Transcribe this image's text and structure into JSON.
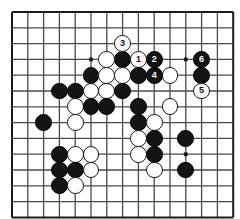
{
  "diagram": {
    "kind": "go-board-diagram",
    "board": {
      "cols": 15,
      "rows": 14,
      "left": 12,
      "top": 12,
      "spacing": 15.8,
      "line_color": "#4a4a4a",
      "edge_color": "#1a1a1a",
      "background": "#ffffff",
      "star_color": "#1a1a1a",
      "star_points": [
        {
          "col": 5,
          "row": 3
        },
        {
          "col": 11,
          "row": 3
        },
        {
          "col": 11,
          "row": 9
        }
      ]
    },
    "colors": {
      "black_stone": "#141414",
      "white_stone": "#fdfdfd",
      "white_stone_border": "#1a1a1a",
      "black_label": "#ffffff",
      "white_label": "#141414"
    },
    "stones": [
      {
        "col": 7,
        "row": 3,
        "color": "black",
        "label": ""
      },
      {
        "col": 6,
        "row": 3,
        "color": "white",
        "label": ""
      },
      {
        "col": 7,
        "row": 2,
        "color": "white",
        "label": "3"
      },
      {
        "col": 8,
        "row": 3,
        "color": "white",
        "label": "1"
      },
      {
        "col": 9,
        "row": 3,
        "color": "black",
        "label": "2"
      },
      {
        "col": 12,
        "row": 3,
        "color": "black",
        "label": "6"
      },
      {
        "col": 5,
        "row": 4,
        "color": "black",
        "label": ""
      },
      {
        "col": 6,
        "row": 4,
        "color": "white",
        "label": ""
      },
      {
        "col": 7,
        "row": 4,
        "color": "white",
        "label": ""
      },
      {
        "col": 8,
        "row": 4,
        "color": "black",
        "label": ""
      },
      {
        "col": 9,
        "row": 4,
        "color": "black",
        "label": "4"
      },
      {
        "col": 10,
        "row": 4,
        "color": "white",
        "label": ""
      },
      {
        "col": 12,
        "row": 4,
        "color": "black",
        "label": ""
      },
      {
        "col": 12,
        "row": 5,
        "color": "white",
        "label": "5"
      },
      {
        "col": 3,
        "row": 5,
        "color": "black",
        "label": ""
      },
      {
        "col": 4,
        "row": 5,
        "color": "black",
        "label": ""
      },
      {
        "col": 5,
        "row": 5,
        "color": "white",
        "label": ""
      },
      {
        "col": 6,
        "row": 5,
        "color": "white",
        "label": ""
      },
      {
        "col": 7,
        "row": 5,
        "color": "black",
        "label": ""
      },
      {
        "col": 4,
        "row": 6,
        "color": "white",
        "label": ""
      },
      {
        "col": 5,
        "row": 6,
        "color": "black",
        "label": ""
      },
      {
        "col": 6,
        "row": 6,
        "color": "black",
        "label": ""
      },
      {
        "col": 8,
        "row": 6,
        "color": "black",
        "label": ""
      },
      {
        "col": 10,
        "row": 6,
        "color": "white",
        "label": ""
      },
      {
        "col": 2,
        "row": 7,
        "color": "black",
        "label": ""
      },
      {
        "col": 4,
        "row": 7,
        "color": "white",
        "label": ""
      },
      {
        "col": 8,
        "row": 7,
        "color": "black",
        "label": ""
      },
      {
        "col": 9,
        "row": 7,
        "color": "white",
        "label": ""
      },
      {
        "col": 8,
        "row": 8,
        "color": "white",
        "label": ""
      },
      {
        "col": 9,
        "row": 8,
        "color": "black",
        "label": ""
      },
      {
        "col": 11,
        "row": 8,
        "color": "black",
        "label": ""
      },
      {
        "col": 3,
        "row": 9,
        "color": "black",
        "label": ""
      },
      {
        "col": 4,
        "row": 9,
        "color": "white",
        "label": ""
      },
      {
        "col": 5,
        "row": 9,
        "color": "white",
        "label": ""
      },
      {
        "col": 8,
        "row": 9,
        "color": "white",
        "label": ""
      },
      {
        "col": 9,
        "row": 9,
        "color": "black",
        "label": ""
      },
      {
        "col": 3,
        "row": 10,
        "color": "black",
        "label": ""
      },
      {
        "col": 4,
        "row": 10,
        "color": "black",
        "label": ""
      },
      {
        "col": 5,
        "row": 10,
        "color": "white",
        "label": ""
      },
      {
        "col": 9,
        "row": 10,
        "color": "white",
        "label": ""
      },
      {
        "col": 11,
        "row": 10,
        "color": "black",
        "label": ""
      },
      {
        "col": 3,
        "row": 11,
        "color": "black",
        "label": ""
      },
      {
        "col": 4,
        "row": 11,
        "color": "white",
        "label": ""
      }
    ],
    "move_numbers": [
      "1",
      "2",
      "3",
      "4",
      "5",
      "6"
    ]
  }
}
